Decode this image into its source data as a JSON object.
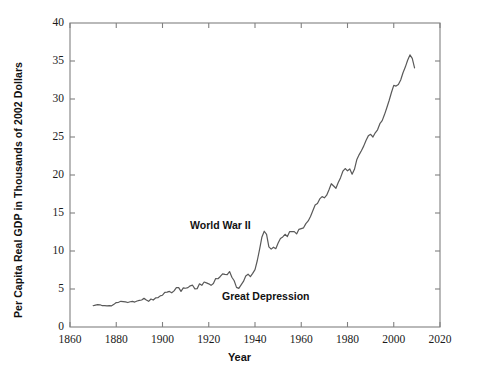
{
  "chart_data": {
    "type": "line",
    "title": "",
    "xlabel": "Year",
    "ylabel": "Per Capita Real GDP in Thousands of 2002 Dollars",
    "xlim": [
      1860,
      2020
    ],
    "ylim": [
      0,
      40
    ],
    "grid": false,
    "legend": "none",
    "line_color": "#595959",
    "axis_color": "#808080",
    "text_color": "#111111",
    "xticks": [
      1860,
      1880,
      1900,
      1920,
      1940,
      1960,
      1980,
      2000,
      2020
    ],
    "xtick_labels": [
      "1860",
      "1880",
      "1900",
      "1920",
      "1940",
      "1960",
      "1980",
      "2000",
      "2020"
    ],
    "yticks": [
      0,
      5,
      10,
      15,
      20,
      25,
      30,
      35,
      40
    ],
    "ytick_labels": [
      "0",
      "5",
      "10",
      "15",
      "20",
      "25",
      "30",
      "35",
      "40"
    ],
    "annotations": [
      {
        "text": "World War II",
        "x": 1942,
        "y": 14.2
      },
      {
        "text": "Great Depression",
        "x": 1947,
        "y": 4.9
      }
    ],
    "series": [
      {
        "name": "Per Capita Real GDP",
        "x": [
          1870,
          1871,
          1872,
          1873,
          1874,
          1875,
          1876,
          1877,
          1878,
          1879,
          1880,
          1881,
          1882,
          1883,
          1884,
          1885,
          1886,
          1887,
          1888,
          1889,
          1890,
          1891,
          1892,
          1893,
          1894,
          1895,
          1896,
          1897,
          1898,
          1899,
          1900,
          1901,
          1902,
          1903,
          1904,
          1905,
          1906,
          1907,
          1908,
          1909,
          1910,
          1911,
          1912,
          1913,
          1914,
          1915,
          1916,
          1917,
          1918,
          1919,
          1920,
          1921,
          1922,
          1923,
          1924,
          1925,
          1926,
          1927,
          1928,
          1929,
          1930,
          1931,
          1932,
          1933,
          1934,
          1935,
          1936,
          1937,
          1938,
          1939,
          1940,
          1941,
          1942,
          1943,
          1944,
          1945,
          1946,
          1947,
          1948,
          1949,
          1950,
          1951,
          1952,
          1953,
          1954,
          1955,
          1956,
          1957,
          1958,
          1959,
          1960,
          1961,
          1962,
          1963,
          1964,
          1965,
          1966,
          1967,
          1968,
          1969,
          1970,
          1971,
          1972,
          1973,
          1974,
          1975,
          1976,
          1977,
          1978,
          1979,
          1980,
          1981,
          1982,
          1983,
          1984,
          1985,
          1986,
          1987,
          1988,
          1989,
          1990,
          1991,
          1992,
          1993,
          1994,
          1995,
          1996,
          1997,
          1998,
          1999,
          2000,
          2001,
          2002,
          2003,
          2004,
          2005,
          2006,
          2007,
          2008,
          2009
        ],
        "y": [
          2.8,
          2.88,
          2.95,
          2.92,
          2.8,
          2.82,
          2.78,
          2.82,
          2.78,
          2.98,
          3.22,
          3.25,
          3.38,
          3.35,
          3.3,
          3.22,
          3.32,
          3.38,
          3.28,
          3.42,
          3.5,
          3.55,
          3.78,
          3.55,
          3.38,
          3.68,
          3.55,
          3.82,
          3.85,
          4.1,
          4.18,
          4.55,
          4.58,
          4.68,
          4.5,
          4.75,
          5.18,
          5.18,
          4.68,
          5.15,
          5.1,
          5.18,
          5.42,
          5.5,
          5.02,
          5.05,
          5.68,
          5.48,
          5.92,
          5.8,
          5.68,
          5.48,
          5.72,
          6.38,
          6.35,
          6.65,
          7.0,
          6.92,
          6.88,
          7.3,
          6.55,
          6.08,
          5.22,
          5.08,
          5.55,
          6.0,
          6.72,
          6.95,
          6.62,
          7.05,
          7.55,
          8.75,
          10.25,
          11.85,
          12.6,
          12.2,
          10.55,
          10.25,
          10.5,
          10.3,
          11.05,
          11.65,
          11.85,
          12.2,
          11.9,
          12.55,
          12.55,
          12.55,
          12.25,
          12.85,
          12.95,
          13.05,
          13.6,
          13.95,
          14.55,
          15.3,
          16.05,
          16.25,
          16.85,
          17.15,
          17.0,
          17.35,
          18.05,
          18.85,
          18.55,
          18.25,
          19.0,
          19.65,
          20.5,
          20.85,
          20.55,
          20.8,
          20.1,
          20.75,
          22.0,
          22.65,
          23.2,
          23.8,
          24.55,
          25.15,
          25.35,
          25.0,
          25.55,
          25.95,
          26.75,
          27.15,
          27.95,
          28.85,
          29.8,
          30.85,
          31.8,
          31.7,
          31.9,
          32.5,
          33.45,
          34.2,
          35.1,
          35.8,
          35.35,
          34.1
        ]
      }
    ]
  },
  "annotations": {
    "wwii": "World War II",
    "great_depression": "Great Depression"
  },
  "axes": {
    "x_title": "Year",
    "y_title": "Per Capita Real GDP in Thousands of 2002 Dollars"
  }
}
